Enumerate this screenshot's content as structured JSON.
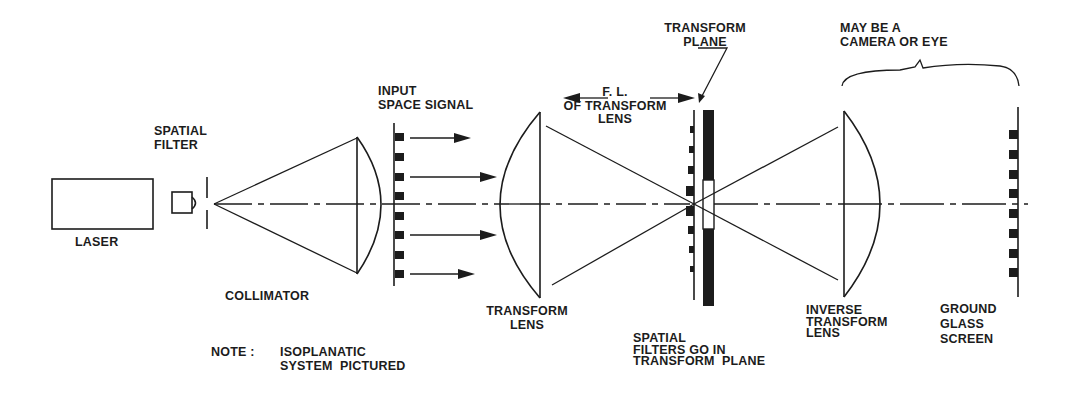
{
  "diagram": {
    "colors": {
      "ink": "#1c1c1c",
      "background": "#ffffff"
    },
    "components": {
      "laser": {
        "label": "LASER"
      },
      "spatial_filter": {
        "label_line1": "SPATIAL",
        "label_line2": "FILTER"
      },
      "collimator": {
        "label": "COLLIMATOR"
      },
      "input_signal": {
        "label_line1": "INPUT",
        "label_line2": "SPACE SIGNAL"
      },
      "focal_length": {
        "label_line1": "F. L.",
        "label_line2": "OF TRANSFORM",
        "label_line3": "LENS"
      },
      "transform_lens": {
        "label_line1": "TRANSFORM",
        "label_line2": "LENS"
      },
      "transform_plane": {
        "label_line1": "TRANSFORM",
        "label_line2": "PLANE"
      },
      "spatial_filters_note": {
        "label_line1": "SPATIAL",
        "label_line2": "FILTERS GO IN",
        "label_line3": "TRANSFORM  PLANE"
      },
      "camera_or_eye": {
        "label_line1": "MAY BE A",
        "label_line2": "CAMERA OR EYE"
      },
      "inverse_transform_lens": {
        "label_line1": "INVERSE",
        "label_line2": "TRANSFORM",
        "label_line3": "LENS"
      },
      "ground_glass_screen": {
        "label_line1": "GROUND",
        "label_line2": "GLASS",
        "label_line3": "SCREEN"
      }
    },
    "note": {
      "prefix": "NOTE :",
      "line1": "ISOPLANATIC",
      "line2": "SYSTEM  PICTURED"
    }
  }
}
